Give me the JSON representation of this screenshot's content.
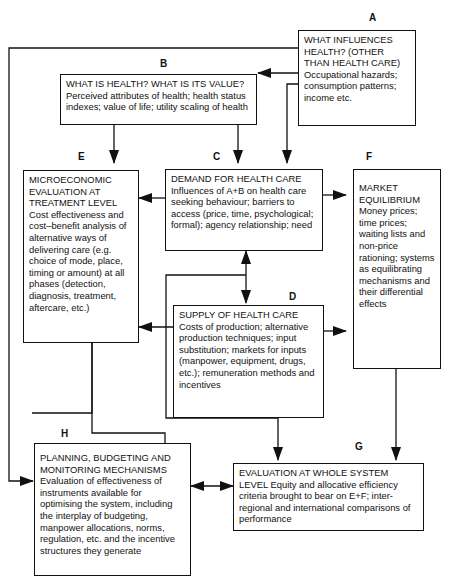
{
  "diagram": {
    "stroke_color": "#111111",
    "background": "#ffffff",
    "nodes": [
      {
        "id": "A",
        "letter": "A",
        "heading": "WHAT INFLUENCES HEALTH? (OTHER THAN HEALTH CARE)",
        "body": "Occupational hazards; consumption patterns; income etc."
      },
      {
        "id": "B",
        "letter": "B",
        "heading": "WHAT IS HEALTH?  WHAT IS ITS VALUE?",
        "body": "Perceived attributes of health; health status indexes; value of life; utility scaling of health"
      },
      {
        "id": "C",
        "letter": "C",
        "heading": "DEMAND FOR HEALTH CARE",
        "body": "Influences of A+B on health care seeking behaviour; barriers to access (price, time, psychological; formal); agency relationship; need"
      },
      {
        "id": "D",
        "letter": "D",
        "heading": "SUPPLY OF HEALTH CARE",
        "body": "Costs of production; alternative production techniques; input substitution; markets for inputs (manpower, equipment, drugs, etc.); remuneration methods and incentives"
      },
      {
        "id": "E",
        "letter": "E",
        "heading": "MICROECONOMIC EVALUATION AT TREATMENT LEVEL",
        "body": "Cost effectiveness and cost–benefit analysis of alternative ways of delivering care (e.g. choice of mode, place, timing or amount) at all phases (detection, diagnosis, treatment, aftercare, etc.)"
      },
      {
        "id": "F",
        "letter": "F",
        "heading": "MARKET EQUILIBRIUM",
        "body": "Money prices; time prices; waiting lists and non-price rationing; systems as equilibrating mechanisms and their differential effects"
      },
      {
        "id": "G",
        "letter": "G",
        "heading": "EVALUATION AT WHOLE SYSTEM LEVEL",
        "body": "Equity and allocative efficiency criteria brought to bear on E+F; inter-regional and international comparisons of performance"
      },
      {
        "id": "H",
        "letter": "H",
        "heading": "PLANNING, BUDGETING AND MONITORING MECHANISMS",
        "body": "Evaluation of effectiveness of instruments available for optimising the system, including the interplay of budgeting, manpower allocations, norms, regulation, etc. and the incentive structures they generate"
      }
    ],
    "edges": [
      {
        "from": "A",
        "to": "B"
      },
      {
        "from": "A",
        "to": "C"
      },
      {
        "from": "A",
        "to": "H"
      },
      {
        "from": "B",
        "to": "E"
      },
      {
        "from": "B",
        "to": "C"
      },
      {
        "from": "C",
        "to": "E"
      },
      {
        "from": "C",
        "to": "F"
      },
      {
        "from": "C",
        "to": "D",
        "bidirectional": true
      },
      {
        "from": "D",
        "to": "E"
      },
      {
        "from": "D",
        "to": "F"
      },
      {
        "from": "D",
        "to": "G"
      },
      {
        "from": "E",
        "to": "G"
      },
      {
        "from": "F",
        "to": "G"
      },
      {
        "from": "H",
        "to": "G",
        "bidirectional": true
      }
    ]
  }
}
